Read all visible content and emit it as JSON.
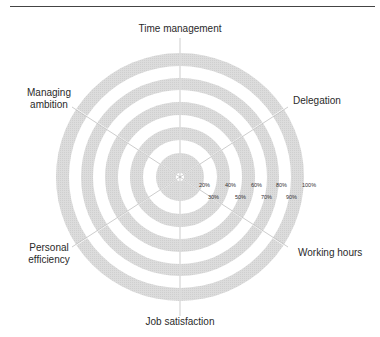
{
  "diagram": {
    "type": "wheel",
    "center": [
      180,
      177
    ],
    "outer_radius": 124,
    "ring_fill": "#dadada",
    "axes": [
      {
        "label": "Time management",
        "angle": 90
      },
      {
        "label": "Delegation",
        "angle": 33
      },
      {
        "label": "Working hours",
        "angle": -33
      },
      {
        "label": "Job satisfaction",
        "angle": -90
      },
      {
        "label": "Personal efficiency",
        "angle": -147
      },
      {
        "label": "Managing ambition",
        "angle": 147
      }
    ],
    "scale_labels": [
      "20%",
      "30%",
      "40%",
      "50%",
      "60%",
      "70%",
      "80%",
      "90%",
      "100%"
    ]
  },
  "labels": {
    "time_management": "Time management",
    "delegation": "Delegation",
    "working_hours": "Working hours",
    "job_satisfaction": "Job satisfaction",
    "personal_efficiency_1": "Personal",
    "personal_efficiency_2": "efficiency",
    "managing_ambition_1": "Managing",
    "managing_ambition_2": "ambition"
  },
  "scale": {
    "p20": "20%",
    "p30": "30%",
    "p40": "40%",
    "p50": "50%",
    "p60": "60%",
    "p70": "70%",
    "p80": "80%",
    "p90": "90%",
    "p100": "100%"
  }
}
